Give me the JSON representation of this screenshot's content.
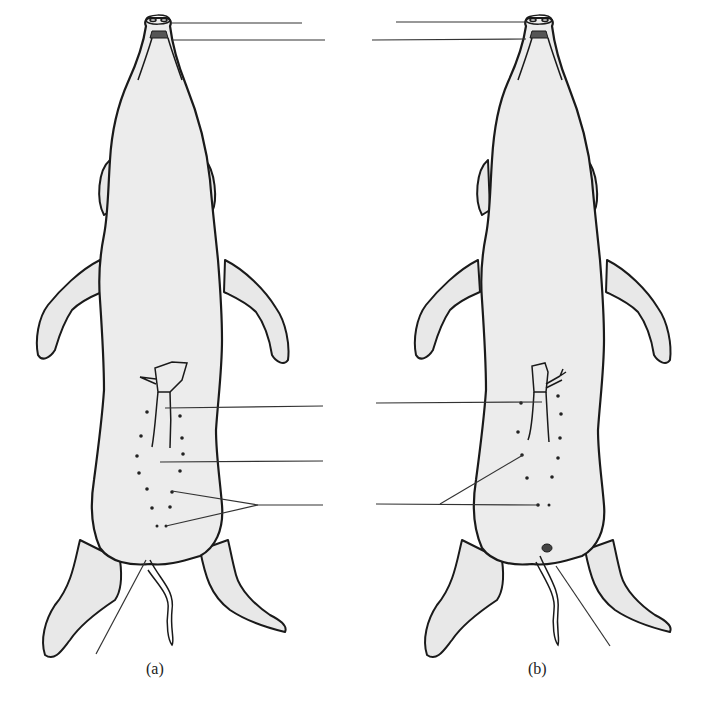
{
  "figure": {
    "panels": [
      {
        "id": "a",
        "caption": "(a)",
        "sex": "male",
        "labels": [
          {
            "target": "snout-nostrils",
            "text": ""
          },
          {
            "target": "mouth",
            "text": ""
          },
          {
            "target": "umbilical-cord",
            "text": ""
          },
          {
            "target": "urogenital-opening",
            "text": ""
          },
          {
            "target": "nipples",
            "text": ""
          },
          {
            "target": "anus",
            "text": ""
          }
        ]
      },
      {
        "id": "b",
        "caption": "(b)",
        "sex": "female",
        "labels": [
          {
            "target": "snout-nostrils",
            "text": ""
          },
          {
            "target": "mouth",
            "text": ""
          },
          {
            "target": "umbilical-cord",
            "text": ""
          },
          {
            "target": "nipples",
            "text": ""
          },
          {
            "target": "urogenital-papilla",
            "text": ""
          }
        ]
      }
    ]
  },
  "colors": {
    "body_fill": "#ececec",
    "outline": "#1a1a1a",
    "leader_line": "#333333",
    "mouth": "#555555"
  }
}
